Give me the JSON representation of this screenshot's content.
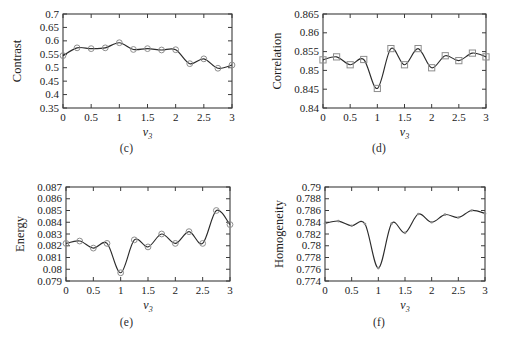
{
  "figure": {
    "background_color": "#ffffff",
    "axis_color": "#3b3b3b",
    "line_color": "#2b2b2b",
    "marker_color": "#8d8d8d",
    "panel_count": 4
  },
  "panels": [
    {
      "caption": "(c)",
      "ylabel": "Contrast",
      "xlabel_main": "v",
      "xlabel_sub": "3"
    },
    {
      "caption": "(d)",
      "ylabel": "Correlation",
      "xlabel_main": "v",
      "xlabel_sub": "3"
    },
    {
      "caption": "(e)",
      "ylabel": "Energy",
      "xlabel_main": "v",
      "xlabel_sub": "3"
    },
    {
      "caption": "(f)",
      "ylabel": "Homogeneity",
      "xlabel_main": "v",
      "xlabel_sub": "3"
    }
  ],
  "chart_data": [
    {
      "type": "line",
      "panel": "(c)",
      "title": "",
      "xlabel": "v3",
      "ylabel": "Contrast",
      "xlim": [
        0,
        3
      ],
      "ylim": [
        0.35,
        0.7
      ],
      "xticks": [
        0,
        0.5,
        1,
        1.5,
        2,
        2.5,
        3
      ],
      "xticklabels": [
        "0",
        "0.5",
        "1",
        "1.5",
        "2",
        "2.5",
        "3"
      ],
      "yticks": [
        0.35,
        0.4,
        0.45,
        0.5,
        0.55,
        0.6,
        0.65,
        0.7
      ],
      "yticklabels": [
        "0.35",
        "0.4",
        "0.45",
        "0.5",
        "0.55",
        "0.6",
        "0.65",
        "0.7"
      ],
      "grid": false,
      "legend": null,
      "marker": "circle",
      "series": [
        {
          "name": "Contrast",
          "x": [
            0,
            0.25,
            0.5,
            0.75,
            1,
            1.25,
            1.5,
            1.75,
            2,
            2.25,
            2.5,
            2.75,
            3
          ],
          "values": [
            0.545,
            0.574,
            0.571,
            0.574,
            0.593,
            0.568,
            0.571,
            0.566,
            0.567,
            0.515,
            0.533,
            0.498,
            0.51
          ]
        }
      ]
    },
    {
      "type": "line",
      "panel": "(d)",
      "title": "",
      "xlabel": "v3",
      "ylabel": "Correlation",
      "xlim": [
        0,
        3
      ],
      "ylim": [
        0.84,
        0.865
      ],
      "xticks": [
        0,
        0.5,
        1,
        1.5,
        2,
        2.5,
        3
      ],
      "xticklabels": [
        "0",
        "0.5",
        "1",
        "1.5",
        "2",
        "2.5",
        "3"
      ],
      "yticks": [
        0.84,
        0.845,
        0.85,
        0.855,
        0.86,
        0.865
      ],
      "yticklabels": [
        "0.84",
        "0.845",
        "0.85",
        "0.855",
        "0.86",
        "0.865"
      ],
      "grid": false,
      "legend": null,
      "marker": "square",
      "series": [
        {
          "name": "Correlation",
          "x": [
            0,
            0.25,
            0.5,
            0.75,
            1,
            1.25,
            1.5,
            1.75,
            2,
            2.25,
            2.5,
            2.75,
            3
          ],
          "values": [
            0.8528,
            0.8536,
            0.8515,
            0.8529,
            0.8452,
            0.8558,
            0.8515,
            0.8558,
            0.8507,
            0.8539,
            0.8526,
            0.8546,
            0.8536
          ]
        }
      ]
    },
    {
      "type": "line",
      "panel": "(e)",
      "title": "",
      "xlabel": "v3",
      "ylabel": "Energy",
      "xlim": [
        0,
        3
      ],
      "ylim": [
        0.079,
        0.087
      ],
      "xticks": [
        0,
        0.5,
        1,
        1.5,
        2,
        2.5,
        3
      ],
      "xticklabels": [
        "0",
        "0.5",
        "1",
        "1.5",
        "2",
        "2.5",
        "3"
      ],
      "yticks": [
        0.079,
        0.08,
        0.081,
        0.082,
        0.083,
        0.084,
        0.085,
        0.086,
        0.087
      ],
      "yticklabels": [
        "0.079",
        "0.08",
        "0.081",
        "0.082",
        "0.083",
        "0.084",
        "0.085",
        "0.086",
        "0.087"
      ],
      "grid": false,
      "legend": null,
      "marker": "circle",
      "series": [
        {
          "name": "Energy",
          "x": [
            0,
            0.25,
            0.5,
            0.75,
            1,
            1.25,
            1.5,
            1.75,
            2,
            2.25,
            2.5,
            2.75,
            3
          ],
          "values": [
            0.0822,
            0.0824,
            0.0818,
            0.0822,
            0.0797,
            0.0825,
            0.0819,
            0.083,
            0.0822,
            0.0832,
            0.0822,
            0.085,
            0.0838
          ]
        }
      ]
    },
    {
      "type": "line",
      "panel": "(f)",
      "title": "",
      "xlabel": "v3",
      "ylabel": "Homogeneity",
      "xlim": [
        0,
        3
      ],
      "ylim": [
        0.774,
        0.79
      ],
      "xticks": [
        0,
        0.5,
        1,
        1.5,
        2,
        2.5,
        3
      ],
      "xticklabels": [
        "0",
        "0.5",
        "1",
        "1.5",
        "2",
        "2.5",
        "3"
      ],
      "yticks": [
        0.774,
        0.776,
        0.778,
        0.78,
        0.782,
        0.784,
        0.786,
        0.788,
        0.79
      ],
      "yticklabels": [
        "0.774",
        "0.776",
        "0.778",
        "0.78",
        "0.782",
        "0.784",
        "0.786",
        "0.788",
        "0.79"
      ],
      "grid": false,
      "legend": null,
      "marker": "dot",
      "series": [
        {
          "name": "Homogeneity",
          "x": [
            0,
            0.25,
            0.5,
            0.75,
            1,
            1.25,
            1.5,
            1.75,
            2,
            2.25,
            2.5,
            2.75,
            3
          ],
          "values": [
            0.7838,
            0.7842,
            0.7834,
            0.7837,
            0.7762,
            0.7838,
            0.7822,
            0.7854,
            0.784,
            0.7853,
            0.7848,
            0.786,
            0.7855
          ]
        }
      ]
    }
  ]
}
